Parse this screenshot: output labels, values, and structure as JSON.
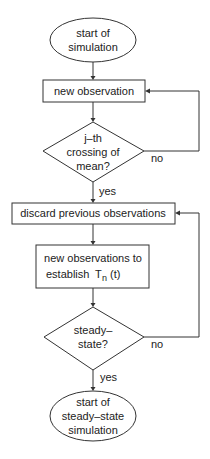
{
  "flowchart": {
    "nodes": {
      "start": {
        "type": "ellipse",
        "lines": [
          "start of",
          "simulation"
        ]
      },
      "new_observation": {
        "type": "process",
        "lines": [
          "new observation"
        ]
      },
      "crossing": {
        "type": "decision",
        "lines": [
          "j–th",
          "crossing of",
          "mean?"
        ]
      },
      "discard": {
        "type": "process",
        "lines": [
          "discard previous observations"
        ]
      },
      "establish": {
        "type": "process",
        "lines": [
          "new observations to",
          "establish"
        ],
        "math": {
          "symbol": "T",
          "subscript": "n",
          "argument": "(t)"
        }
      },
      "steady": {
        "type": "decision",
        "lines": [
          "steady–",
          "state?"
        ]
      },
      "end": {
        "type": "ellipse",
        "lines": [
          "start of",
          "steady–state",
          "simulation"
        ]
      }
    },
    "edges": {
      "crossing_no": "no",
      "crossing_yes": "yes",
      "steady_no": "no",
      "steady_yes": "yes"
    },
    "colors": {
      "stroke": "#333333",
      "text": "#222222",
      "background": "#ffffff"
    }
  }
}
